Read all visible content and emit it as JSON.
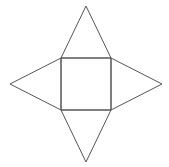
{
  "diagram": {
    "type": "net",
    "stroke_color": "#555555",
    "stroke_width": 1,
    "background": "#ffffff",
    "square": {
      "points": [
        [
          61,
          58
        ],
        [
          111,
          58
        ],
        [
          111,
          110
        ],
        [
          61,
          110
        ]
      ]
    },
    "triangles": [
      {
        "name": "top",
        "points": [
          [
            61,
            58
          ],
          [
            86,
            6
          ],
          [
            111,
            58
          ]
        ]
      },
      {
        "name": "right",
        "points": [
          [
            111,
            58
          ],
          [
            162,
            84
          ],
          [
            111,
            110
          ]
        ]
      },
      {
        "name": "bottom",
        "points": [
          [
            61,
            110
          ],
          [
            86,
            162
          ],
          [
            111,
            110
          ]
        ]
      },
      {
        "name": "left",
        "points": [
          [
            61,
            58
          ],
          [
            10,
            84
          ],
          [
            61,
            110
          ]
        ]
      }
    ]
  }
}
